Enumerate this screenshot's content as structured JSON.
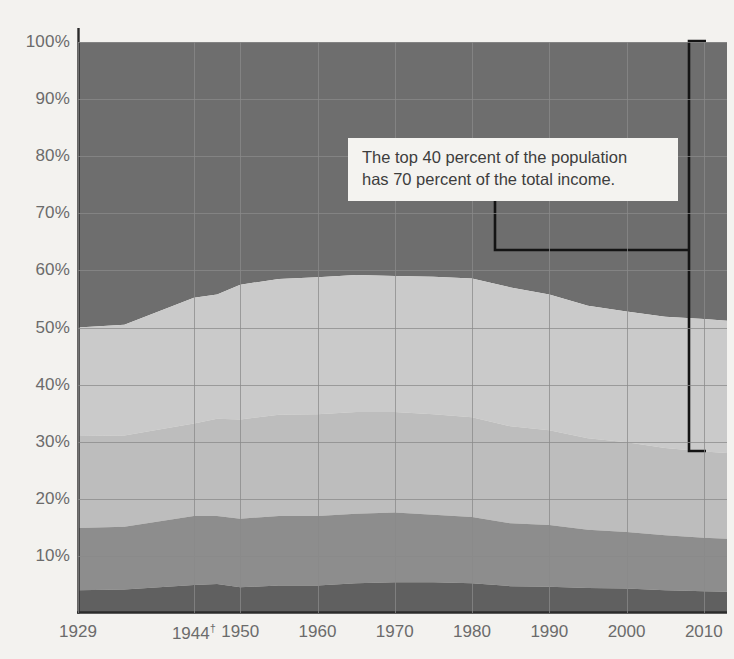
{
  "chart_data": {
    "type": "area",
    "title": "",
    "subtitle": "",
    "xlabel": "",
    "ylabel": "",
    "stacked": true,
    "percent_stacked": true,
    "grid": true,
    "legend_position": "none",
    "xlim": [
      1929,
      2013
    ],
    "ylim": [
      0,
      100
    ],
    "y_ticks": [
      10,
      20,
      30,
      40,
      50,
      60,
      70,
      80,
      90,
      100
    ],
    "y_tick_labels": [
      "10%",
      "20%",
      "30%",
      "40%",
      "50%",
      "60%",
      "70%",
      "80%",
      "90%",
      "100%"
    ],
    "x_ticks": [
      1929,
      1944,
      1950,
      1960,
      1970,
      1980,
      1990,
      2000,
      2010
    ],
    "x_tick_labels": [
      "1929",
      "1944†",
      "1950",
      "1960",
      "1970",
      "1980",
      "1990",
      "2000",
      "2010"
    ],
    "x": [
      1929,
      1935,
      1944,
      1947,
      1950,
      1955,
      1960,
      1965,
      1970,
      1975,
      1980,
      1985,
      1990,
      1995,
      2000,
      2005,
      2010,
      2013
    ],
    "series": [
      {
        "name": "Lowest fifth",
        "color": "#606060",
        "values": [
          4.0,
          4.1,
          4.9,
          5.1,
          4.5,
          4.8,
          4.8,
          5.2,
          5.4,
          5.4,
          5.2,
          4.7,
          4.6,
          4.4,
          4.3,
          4.0,
          3.8,
          3.7
        ]
      },
      {
        "name": "Second fifth",
        "color": "#8d8d8d",
        "values": [
          10.9,
          11.0,
          12.1,
          11.9,
          12.0,
          12.2,
          12.2,
          12.2,
          12.2,
          11.8,
          11.6,
          11.0,
          10.8,
          10.2,
          9.9,
          9.6,
          9.4,
          9.3
        ]
      },
      {
        "name": "Third fifth",
        "color": "#bdbdbd",
        "values": [
          16.1,
          16.0,
          16.2,
          17.0,
          17.4,
          17.7,
          17.8,
          17.8,
          17.6,
          17.6,
          17.5,
          17.0,
          16.6,
          16.0,
          15.7,
          15.3,
          15.1,
          15.0
        ]
      },
      {
        "name": "Fourth fifth",
        "color": "#cacaca",
        "values": [
          19.0,
          19.4,
          22.0,
          21.8,
          23.6,
          23.8,
          24.0,
          24.0,
          23.8,
          24.1,
          24.3,
          24.3,
          23.8,
          23.2,
          22.9,
          23.0,
          23.2,
          23.2
        ]
      },
      {
        "name": "Highest fifth",
        "color": "#6e6e6e",
        "values": [
          50.0,
          49.5,
          44.8,
          44.2,
          42.5,
          41.5,
          41.2,
          40.8,
          41.0,
          41.1,
          41.4,
          43.0,
          44.2,
          46.2,
          47.2,
          48.1,
          48.5,
          48.8
        ]
      }
    ],
    "boundaries_cumulative_note": "Cumulative top-of-band values: band1 ~4-5%, band2 ~15-17%, band3 ~31-33%, band4 ~50-60% (top of fourth fifth), band5 = 100%",
    "annotation": {
      "lines": [
        "The top 40 percent of the population",
        "has 70 percent of the total income."
      ],
      "bracket_from_percent": 100,
      "bracket_to_percent": 30,
      "bracket_at_year": 2011
    },
    "footnote_marker": "†"
  },
  "colors": {
    "background": "#f3f2ef",
    "axis": "#2b2b2b",
    "gridline": "#8a8a8a",
    "tick_text": "#6b6b6b",
    "annotation_bg": "#f4f3f0",
    "annotation_text": "#3d3d3d",
    "leader_line": "#141414"
  }
}
